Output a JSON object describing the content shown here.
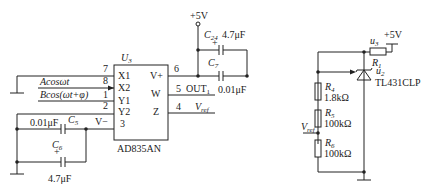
{
  "left_circuit": {
    "chip": {
      "ref": "U",
      "ref_sub": "3",
      "part": "AD835AN",
      "pins_left": [
        {
          "num": "7",
          "name": "X1"
        },
        {
          "num": "8",
          "name": "X2"
        },
        {
          "num": "1",
          "name": "Y1"
        },
        {
          "num": "2",
          "name": "Y2"
        },
        {
          "num": "3",
          "name": ""
        }
      ],
      "pins_right": [
        {
          "num": "6",
          "name": "V+"
        },
        {
          "num": "5",
          "name": "W"
        },
        {
          "num": "4",
          "name": "Z"
        }
      ]
    },
    "inputs": {
      "x_signal": "Acosωt",
      "y_signal": "Bcos(ωt+φ)"
    },
    "supply": "+5V",
    "c24": {
      "ref": "C",
      "sub": "24",
      "value": "4.7μF",
      "polarity": "+"
    },
    "c7": {
      "ref": "C",
      "sub": "7",
      "value": "0.01μF"
    },
    "out_label": "OUT",
    "out_sub": "1",
    "vref_label": "V",
    "vref_sub": "ref",
    "vminus_label": "V−",
    "c5": {
      "ref": "C",
      "sub": "5",
      "value": "0.01μF"
    },
    "c6": {
      "ref": "C",
      "sub": "6",
      "value": "4.7μF",
      "polarity": "+"
    }
  },
  "right_circuit": {
    "supply": "+5V",
    "u3": {
      "ref": "u",
      "sub": "3"
    },
    "r1": {
      "ref": "R",
      "sub": "1"
    },
    "u2": {
      "ref": "u",
      "sub": "2"
    },
    "regulator": "TL431CLP",
    "r4": {
      "ref": "R",
      "sub": "4",
      "value": "1.8kΩ"
    },
    "r5": {
      "ref": "R",
      "sub": "5",
      "value": "100kΩ"
    },
    "r6": {
      "ref": "R",
      "sub": "6",
      "value": "100kΩ"
    },
    "vref_label": "V",
    "vref_sub": "ref"
  }
}
